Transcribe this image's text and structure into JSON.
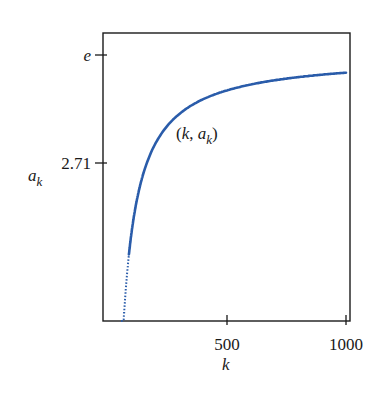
{
  "chart_data": {
    "type": "line",
    "title": "",
    "xlabel": "k",
    "ylabel": "a_k",
    "xlim": [
      0,
      1020
    ],
    "ylim": [
      2.6979,
      2.72
    ],
    "x_ticks": [
      {
        "value": 500,
        "label": "500"
      },
      {
        "value": 1000,
        "label": "1000"
      }
    ],
    "y_ticks": [
      {
        "value": 2.71828,
        "label": "e"
      },
      {
        "value": 2.71,
        "label": "2.71"
      }
    ],
    "grid": false,
    "legend": null,
    "annotation": {
      "text": "(k, a_k)",
      "x": 300,
      "y": 2.7115
    },
    "series": [
      {
        "name": "a_k = (1 + 1/k)^k",
        "color": "#2a5caa",
        "x": [
          55,
          60,
          70,
          80,
          100,
          125,
          150,
          200,
          250,
          300,
          400,
          500,
          600,
          700,
          800,
          900,
          1000
        ],
        "values": [
          2.6939,
          2.6958,
          2.6992,
          2.7015,
          2.7048,
          2.7075,
          2.7093,
          2.7115,
          2.7129,
          2.7138,
          2.7149,
          2.7156,
          2.716,
          2.7163,
          2.7166,
          2.7168,
          2.7169
        ]
      }
    ]
  }
}
